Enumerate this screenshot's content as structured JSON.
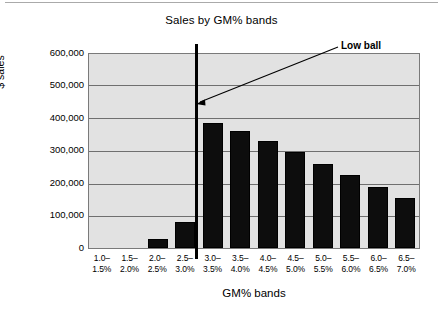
{
  "chart_data": {
    "type": "bar",
    "title": "Sales by GM% bands",
    "xlabel": "GM% bands",
    "ylabel": "$ sales",
    "categories": [
      "1.0–1.5%",
      "1.5–2.0%",
      "2.0–2.5%",
      "2.5–3.0%",
      "3.0–3.5%",
      "3.5–4.0%",
      "4.0–4.5%",
      "4.5–5.0%",
      "5.0–5.5%",
      "5.5–6.0%",
      "6.0–6.5%",
      "6.5–7.0%"
    ],
    "category_lines": [
      [
        "1.0–",
        "1.5%"
      ],
      [
        "1.5–",
        "2.0%"
      ],
      [
        "2.0–",
        "2.5%"
      ],
      [
        "2.5–",
        "3.0%"
      ],
      [
        "3.0–",
        "3.5%"
      ],
      [
        "3.5–",
        "4.0%"
      ],
      [
        "4.0–",
        "4.5%"
      ],
      [
        "4.5–",
        "5.0%"
      ],
      [
        "5.0–",
        "5.5%"
      ],
      [
        "5.5–",
        "6.0%"
      ],
      [
        "6.0–",
        "6.5%"
      ],
      [
        "6.5–",
        "7.0%"
      ]
    ],
    "values": [
      0,
      0,
      27500,
      80000,
      388000,
      363000,
      330000,
      296000,
      261000,
      226000,
      188000,
      156000
    ],
    "ylim": [
      0,
      600000
    ],
    "ytick_values": [
      600000,
      500000,
      400000,
      300000,
      200000,
      100000,
      0
    ],
    "ytick_labels": [
      "600,000",
      "500,000",
      "400,000",
      "300,000",
      "200,000",
      "100,000",
      "0"
    ],
    "grid": true,
    "legend": "none",
    "bar_color": "#0d0d0d",
    "plot_background": "#e2e2e2",
    "annotations": [
      {
        "text": "Low ball",
        "kind": "arrow-callout",
        "points_to_category": "3.0–3.5%"
      }
    ],
    "markers": [
      {
        "kind": "vertical-divider",
        "position": "between 2.5–3.0% and 3.0–3.5%",
        "color": "#000000"
      }
    ]
  }
}
